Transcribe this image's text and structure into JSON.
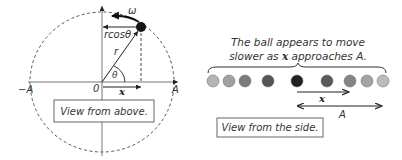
{
  "top_view": {
    "caption": "View from above.",
    "labels": {
      "omega": "ω",
      "rcos": "rcosθ",
      "r": "r",
      "theta": "θ",
      "origin": "0",
      "x": "x",
      "neg_A": "−A",
      "pos_A": "A"
    }
  },
  "side_view": {
    "description_line1": "The ball appears to move",
    "description_line2_pre": "slower as ",
    "description_line2_bold": "x",
    "description_line2_post": " approaches A.",
    "x_label": "x",
    "A_label": "A",
    "caption": "View from the side.",
    "balls": [
      {
        "cx": 213,
        "fill": "#b4b4b4"
      },
      {
        "cx": 229,
        "fill": "#a0a0a0"
      },
      {
        "cx": 245,
        "fill": "#7c7c7c"
      },
      {
        "cx": 268,
        "fill": "#555555"
      },
      {
        "cx": 297,
        "fill": "#222222"
      },
      {
        "cx": 327,
        "fill": "#5a5a5a"
      },
      {
        "cx": 350,
        "fill": "#858585"
      },
      {
        "cx": 367,
        "fill": "#a4a4a4"
      },
      {
        "cx": 383,
        "fill": "#bcbcbc"
      }
    ]
  }
}
